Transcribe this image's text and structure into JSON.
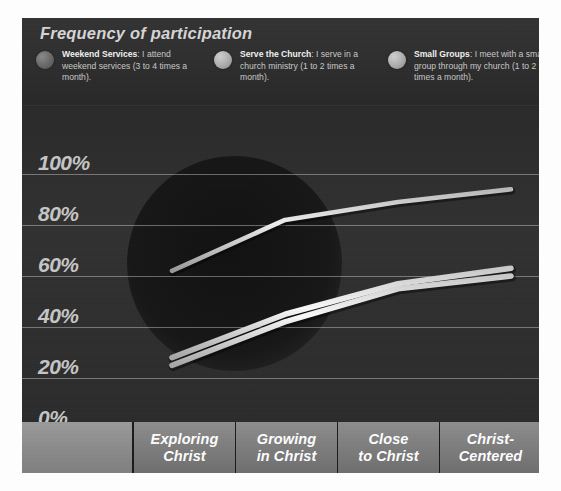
{
  "chart": {
    "title": "Frequency of participation",
    "legend": [
      {
        "name": "Weekend Services",
        "description": ": I attend weekend services (3 to 4 times a month).",
        "dot": "legend-dot-weekend-services",
        "color": "#6e6e6e"
      },
      {
        "name": "Serve the Church",
        "description": ": I serve in a church ministry (1 to 2 times a month).",
        "dot": "legend-dot-serve-the-church",
        "color": "#b2b2b2"
      },
      {
        "name": "Small Groups",
        "description": ": I meet with a small group through my church (1 to 2 times a month).",
        "dot": "legend-dot-small-groups",
        "color": "#b2b2b2"
      }
    ]
  },
  "chart_data": {
    "type": "line",
    "title": "Frequency of participation",
    "xlabel": "",
    "ylabel": "",
    "ylim": [
      0,
      100
    ],
    "yticks": [
      "0%",
      "20%",
      "40%",
      "60%",
      "80%",
      "100%"
    ],
    "grid": true,
    "legend_position": "top",
    "categories": [
      "Exploring Christ",
      "Growing in Christ",
      "Close to Christ",
      "Christ-Centered"
    ],
    "series": [
      {
        "name": "Weekend Services",
        "values": [
          62,
          82,
          89,
          94
        ]
      },
      {
        "name": "Serve the Church",
        "values": [
          28,
          45,
          57,
          63
        ]
      },
      {
        "name": "Small Groups",
        "values": [
          25,
          42,
          55,
          60
        ]
      }
    ]
  },
  "axis": {
    "ticks": [
      {
        "label": "100%",
        "value": 100
      },
      {
        "label": "80%",
        "value": 80
      },
      {
        "label": "60%",
        "value": 60
      },
      {
        "label": "40%",
        "value": 40
      },
      {
        "label": "20%",
        "value": 20
      },
      {
        "label": "0%",
        "value": 0
      }
    ]
  },
  "categories": [
    {
      "label": "Exploring\nChrist"
    },
    {
      "label": "Growing\nin Christ"
    },
    {
      "label": "Close\nto Christ"
    },
    {
      "label": "Christ-\nCentered"
    }
  ]
}
